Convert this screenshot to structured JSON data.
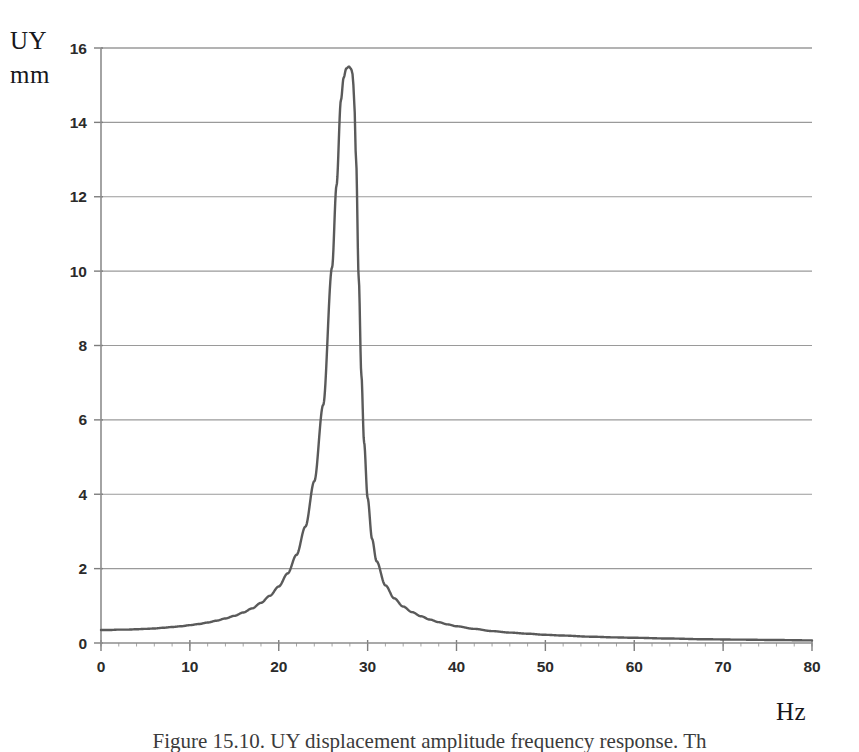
{
  "figure": {
    "y_axis_title_line1": "UY",
    "y_axis_title_line2": "mm",
    "x_axis_title": "Hz",
    "caption": "Figure 15.10. UY displacement amplitude frequency response. Th"
  },
  "chart_data": {
    "type": "line",
    "title": "",
    "subtitle": "",
    "xlabel": "Hz",
    "ylabel": "UY mm",
    "xlim": [
      0,
      80
    ],
    "ylim": [
      0,
      16
    ],
    "xticks": [
      0,
      10,
      20,
      30,
      40,
      50,
      60,
      70,
      80
    ],
    "yticks": [
      0,
      2,
      4,
      6,
      8,
      10,
      12,
      14,
      16
    ],
    "xtick_labels": [
      "0",
      "10",
      "20",
      "30",
      "40",
      "50",
      "60",
      "70",
      "80"
    ],
    "ytick_labels": [
      "0",
      "2",
      "4",
      "6",
      "8",
      "10",
      "12",
      "14",
      "16"
    ],
    "grid": "horizontal",
    "legend": "none",
    "minor_xticks_step": 2,
    "series": [
      {
        "name": "UY displacement amplitude",
        "color": "#5a5a5a",
        "line_width": 2.4,
        "peak_x": 28.3,
        "peak_y": 15.5,
        "x": [
          0,
          1,
          2,
          3,
          4,
          5,
          6,
          7,
          8,
          9,
          10,
          11,
          12,
          13,
          14,
          15,
          16,
          17,
          18,
          19,
          20,
          21,
          22,
          23,
          24,
          25,
          26,
          26.5,
          27,
          27.3,
          27.6,
          27.9,
          28.1,
          28.2,
          28.3,
          28.4,
          28.5,
          28.7,
          29,
          29.3,
          29.6,
          30,
          30.5,
          31,
          32,
          33,
          34,
          35,
          36,
          37,
          38,
          39,
          40,
          42,
          44,
          46,
          48,
          50,
          52,
          55,
          58,
          60,
          64,
          68,
          72,
          76,
          80
        ],
        "y": [
          0.35,
          0.35,
          0.36,
          0.36,
          0.37,
          0.38,
          0.39,
          0.41,
          0.43,
          0.45,
          0.48,
          0.51,
          0.55,
          0.6,
          0.66,
          0.73,
          0.82,
          0.93,
          1.08,
          1.27,
          1.52,
          1.87,
          2.37,
          3.13,
          4.35,
          6.4,
          10.1,
          12.3,
          14.6,
          15.2,
          15.45,
          15.5,
          15.45,
          15.4,
          15.3,
          15.0,
          14.5,
          13.0,
          9.8,
          7.2,
          5.4,
          3.9,
          2.8,
          2.2,
          1.55,
          1.2,
          0.98,
          0.83,
          0.72,
          0.63,
          0.56,
          0.5,
          0.45,
          0.38,
          0.32,
          0.28,
          0.25,
          0.22,
          0.2,
          0.17,
          0.15,
          0.14,
          0.12,
          0.1,
          0.09,
          0.08,
          0.07
        ]
      }
    ]
  }
}
